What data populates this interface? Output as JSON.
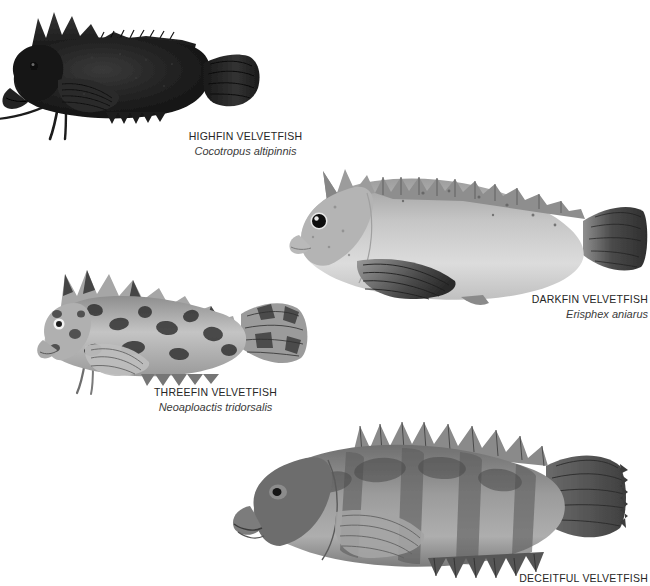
{
  "page": {
    "background_color": "#ffffff",
    "text_color": "#262626",
    "sci_text_color": "#3a3a3a"
  },
  "plate": {
    "figures": [
      {
        "id": "highfin",
        "common_name": "HIGHFIN VELVETFISH",
        "scientific_name": "Cocotropus altipinnis",
        "icon": "fish-illustration-highfin-velvetfish",
        "tone": "very dark, near-black body",
        "orientation": "facing left",
        "body_fill": "#1c1c1c",
        "fin_fill": "#2a2a2a"
      },
      {
        "id": "darkfin",
        "common_name": "DARKFIN VELVETFISH",
        "scientific_name": "Erisphex aniarus",
        "icon": "fish-illustration-darkfin-velvetfish",
        "tone": "pale grey body with dark fins",
        "orientation": "facing left",
        "body_fill": "#c3c3c3",
        "fin_fill": "#4a4a4a"
      },
      {
        "id": "threefin",
        "common_name": "THREEFIN VELVETFISH",
        "scientific_name": "Neoaploactis tridorsalis",
        "icon": "fish-illustration-threefin-velvetfish",
        "tone": "mottled grey with dark blotches",
        "orientation": "facing left",
        "body_fill": "#b0b0b0",
        "fin_fill": "#6a6a6a"
      },
      {
        "id": "deceitful",
        "common_name": "DECEITFUL VELVETFISH",
        "scientific_name": "",
        "icon": "fish-illustration-deceitful-velvetfish",
        "tone": "medium grey with broad vertical bars",
        "orientation": "facing left",
        "body_fill": "#8f8f8f",
        "fin_fill": "#5c5c5c",
        "caption_clipped": "true"
      }
    ]
  }
}
